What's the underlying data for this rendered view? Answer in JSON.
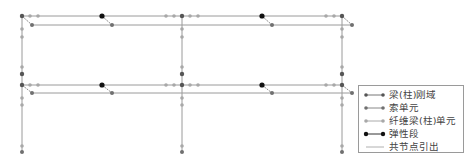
{
  "diagram": {
    "title": "",
    "colors": {
      "line": "#9a9a9a",
      "joint_node": "#555555",
      "cable_node": "#707070",
      "fiber_node": "#a8a8a8",
      "elastic_node": "#111111",
      "shared_node_line": "#b0b0b0"
    }
  },
  "legend": {
    "items": [
      {
        "label": "梁(柱)刚域",
        "marker": "joint-rigid-zone"
      },
      {
        "label": "索单元",
        "marker": "cable-element"
      },
      {
        "label": "纤维梁(柱)单元",
        "marker": "fiber-beam-column-element"
      },
      {
        "label": "弹性段",
        "marker": "elastic-segment"
      },
      {
        "label": "共节点引出",
        "marker": "shared-node-lead"
      }
    ]
  }
}
